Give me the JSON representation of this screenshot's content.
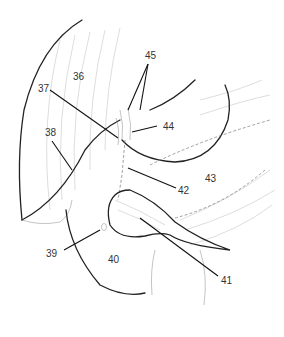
{
  "figure": {
    "type": "anatomical-line-drawing",
    "labels": [
      {
        "id": "36",
        "text": "36",
        "x": 73,
        "y": 72
      },
      {
        "id": "37",
        "text": "37",
        "x": 38,
        "y": 84
      },
      {
        "id": "38",
        "text": "38",
        "x": 45,
        "y": 128
      },
      {
        "id": "39",
        "text": "39",
        "x": 46,
        "y": 249
      },
      {
        "id": "40",
        "text": "40",
        "x": 108,
        "y": 255
      },
      {
        "id": "41",
        "text": "41",
        "x": 221,
        "y": 276
      },
      {
        "id": "42",
        "text": "42",
        "x": 178,
        "y": 186
      },
      {
        "id": "43",
        "text": "43",
        "x": 205,
        "y": 174
      },
      {
        "id": "44",
        "text": "44",
        "x": 163,
        "y": 122
      },
      {
        "id": "45",
        "text": "45",
        "x": 145,
        "y": 51
      }
    ]
  }
}
